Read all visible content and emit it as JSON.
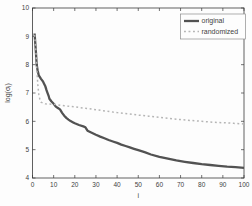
{
  "figure": {
    "background": "#fdfdfd",
    "frame_color": "#3a3a3a"
  },
  "chart_data": {
    "type": "line",
    "title": "",
    "xlabel": "i",
    "ylabel": "log(σ_i)",
    "ylabel_parts": {
      "pre": "log(σ",
      "sub": "i",
      "post": ")"
    },
    "xlim": [
      0,
      100
    ],
    "ylim": [
      4,
      10
    ],
    "xticks": [
      0,
      10,
      20,
      30,
      40,
      50,
      60,
      70,
      80,
      90,
      100
    ],
    "yticks": [
      4,
      5,
      6,
      7,
      8,
      9,
      10
    ],
    "grid": false,
    "legend_position": "top-right",
    "series": [
      {
        "name": "original",
        "style": "solid",
        "color": "#525252",
        "width": 2.3,
        "points": [
          [
            1,
            9.1
          ],
          [
            1.6,
            8.45
          ],
          [
            2,
            8.0
          ],
          [
            2.4,
            7.8
          ],
          [
            3,
            7.62
          ],
          [
            4,
            7.5
          ],
          [
            5,
            7.4
          ],
          [
            6,
            7.25
          ],
          [
            6.6,
            7.1
          ],
          [
            7,
            7.02
          ],
          [
            7.6,
            6.9
          ],
          [
            8,
            6.8
          ],
          [
            9,
            6.7
          ],
          [
            10,
            6.62
          ],
          [
            11,
            6.52
          ],
          [
            12,
            6.47
          ],
          [
            13,
            6.42
          ],
          [
            14,
            6.3
          ],
          [
            15,
            6.2
          ],
          [
            16,
            6.12
          ],
          [
            17,
            6.06
          ],
          [
            18,
            6.01
          ],
          [
            19,
            5.97
          ],
          [
            20,
            5.93
          ],
          [
            22,
            5.87
          ],
          [
            24,
            5.82
          ],
          [
            25,
            5.79
          ],
          [
            26,
            5.67
          ],
          [
            28,
            5.6
          ],
          [
            30,
            5.53
          ],
          [
            32,
            5.46
          ],
          [
            34,
            5.4
          ],
          [
            36,
            5.34
          ],
          [
            38,
            5.29
          ],
          [
            40,
            5.24
          ],
          [
            42,
            5.18
          ],
          [
            44,
            5.13
          ],
          [
            46,
            5.08
          ],
          [
            48,
            5.03
          ],
          [
            50,
            4.98
          ],
          [
            53,
            4.91
          ],
          [
            56,
            4.83
          ],
          [
            60,
            4.75
          ],
          [
            64,
            4.68
          ],
          [
            68,
            4.62
          ],
          [
            72,
            4.57
          ],
          [
            76,
            4.53
          ],
          [
            80,
            4.49
          ],
          [
            84,
            4.46
          ],
          [
            88,
            4.43
          ],
          [
            92,
            4.4
          ],
          [
            96,
            4.38
          ],
          [
            100,
            4.36
          ]
        ]
      },
      {
        "name": "randomized",
        "style": "dashed",
        "color": "#b5b5b5",
        "width": 1.5,
        "points": [
          [
            1,
            9.05
          ],
          [
            1.6,
            8.5
          ],
          [
            2,
            7.9
          ],
          [
            2.5,
            7.3
          ],
          [
            3,
            6.95
          ],
          [
            3.5,
            6.77
          ],
          [
            4,
            6.68
          ],
          [
            5,
            6.64
          ],
          [
            6,
            6.62
          ],
          [
            8,
            6.61
          ],
          [
            10,
            6.6
          ],
          [
            12,
            6.58
          ],
          [
            15,
            6.55
          ],
          [
            20,
            6.51
          ],
          [
            25,
            6.46
          ],
          [
            30,
            6.41
          ],
          [
            35,
            6.36
          ],
          [
            40,
            6.31
          ],
          [
            45,
            6.27
          ],
          [
            50,
            6.22
          ],
          [
            55,
            6.18
          ],
          [
            60,
            6.14
          ],
          [
            65,
            6.1
          ],
          [
            70,
            6.06
          ],
          [
            75,
            6.03
          ],
          [
            80,
            6.0
          ],
          [
            85,
            5.97
          ],
          [
            90,
            5.95
          ],
          [
            95,
            5.93
          ],
          [
            100,
            5.91
          ]
        ]
      }
    ]
  }
}
